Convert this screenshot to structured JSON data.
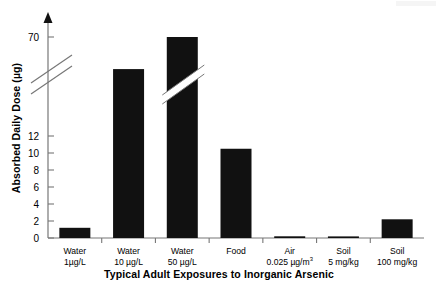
{
  "chart_data": {
    "type": "bar",
    "title": "",
    "xlabel": "Typical Adult Exposures to Inorganic Arsenic",
    "ylabel": "Absorbed Daily Dose (µg)",
    "categories": [
      "Water 1µg/L",
      "Water 10 µg/L",
      "Water 50 µg/L",
      "Food",
      "Air 0.025 µg/m3",
      "Soil 5 mg/kg",
      "Soil 100 mg/kg"
    ],
    "category_lines": [
      {
        "line1": "Water",
        "line2": "1µg/L"
      },
      {
        "line1": "Water",
        "line2": "10 µg/L"
      },
      {
        "line1": "Water",
        "line2": "50 µg/L"
      },
      {
        "line1": "Food",
        "line2": ""
      },
      {
        "line1": "Air",
        "line2": "0.025 µg/m",
        "line2_sup": "3"
      },
      {
        "line1": "Soil",
        "line2": "5 mg/kg"
      },
      {
        "line1": "Soil",
        "line2": "100 mg/kg"
      }
    ],
    "values": [
      1.2,
      13.6,
      70,
      10.5,
      0.2,
      0.1,
      2.2
    ],
    "ytick_labels": [
      "0",
      "2",
      "4",
      "6",
      "8",
      "10",
      "12",
      "70"
    ],
    "ytick_values": [
      0,
      2,
      4,
      6,
      8,
      10,
      12,
      70
    ],
    "ylim": [
      0,
      70
    ],
    "axis_break": {
      "present": true,
      "between": [
        12,
        70
      ],
      "style": "double-diagonal-slash"
    },
    "grid": false,
    "legend": null,
    "bar_color": "#111111",
    "axis_color": "#777777",
    "y_axis_arrow": true
  },
  "figure": {
    "background": "#ffffff",
    "text_color": "#000000"
  }
}
